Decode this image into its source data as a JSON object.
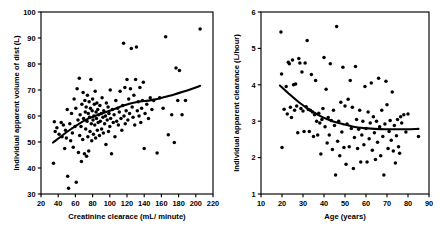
{
  "figure": {
    "background": "#ffffff",
    "ink": "#000000",
    "panel_count": 2
  },
  "chart_data": [
    {
      "type": "scatter",
      "panel": "left",
      "title": "",
      "xlabel": "Creatinine clearace (mL/ minute)",
      "ylabel": "Individual apparent volume of dist (L)",
      "xlim": [
        20,
        220
      ],
      "ylim": [
        30,
        100
      ],
      "xticks": [
        20,
        40,
        60,
        80,
        100,
        120,
        140,
        160,
        180,
        200,
        220
      ],
      "yticks": [
        30,
        40,
        50,
        60,
        70,
        80,
        90,
        100
      ],
      "grid": false,
      "legend": "none",
      "marker": "filled-circle",
      "points": [
        [
          34.5,
          41.8
        ],
        [
          35.5,
          57.8
        ],
        [
          36.5,
          54.0
        ],
        [
          38.5,
          55.5
        ],
        [
          41.0,
          53.0
        ],
        [
          43.5,
          57.5
        ],
        [
          44.5,
          52.0
        ],
        [
          46.0,
          56.5
        ],
        [
          47.5,
          47.5
        ],
        [
          48.5,
          54.5
        ],
        [
          49.5,
          51.5
        ],
        [
          50.5,
          62.5
        ],
        [
          51.0,
          36.8
        ],
        [
          52.0,
          32.2
        ],
        [
          53.5,
          57.0
        ],
        [
          54.5,
          50.5
        ],
        [
          55.5,
          61.0
        ],
        [
          56.5,
          53.5
        ],
        [
          57.5,
          48.0
        ],
        [
          58.5,
          66.5
        ],
        [
          59.5,
          56.0
        ],
        [
          60.5,
          63.0
        ],
        [
          61.0,
          34.5
        ],
        [
          62.0,
          70.5
        ],
        [
          63.0,
          58.5
        ],
        [
          63.5,
          46.0
        ],
        [
          64.5,
          74.5
        ],
        [
          65.0,
          52.5
        ],
        [
          65.5,
          60.5
        ],
        [
          66.5,
          56.0
        ],
        [
          67.0,
          42.5
        ],
        [
          67.5,
          64.5
        ],
        [
          68.5,
          51.0
        ],
        [
          69.0,
          69.0
        ],
        [
          69.5,
          59.0
        ],
        [
          70.5,
          45.5
        ],
        [
          71.0,
          66.0
        ],
        [
          71.5,
          61.5
        ],
        [
          72.0,
          55.0
        ],
        [
          72.5,
          63.5
        ],
        [
          73.0,
          44.5
        ],
        [
          73.5,
          58.0
        ],
        [
          74.0,
          68.0
        ],
        [
          74.5,
          52.0
        ],
        [
          75.0,
          61.0
        ],
        [
          75.5,
          46.5
        ],
        [
          76.0,
          65.5
        ],
        [
          76.5,
          59.5
        ],
        [
          77.0,
          54.0
        ],
        [
          77.5,
          63.0
        ],
        [
          78.0,
          74.0
        ],
        [
          78.5,
          57.0
        ],
        [
          79.0,
          50.5
        ],
        [
          79.5,
          62.0
        ],
        [
          80.0,
          66.5
        ],
        [
          80.5,
          58.5
        ],
        [
          81.0,
          53.0
        ],
        [
          81.5,
          60.0
        ],
        [
          82.0,
          64.5
        ],
        [
          82.5,
          56.5
        ],
        [
          83.0,
          69.5
        ],
        [
          83.5,
          51.5
        ],
        [
          84.0,
          61.5
        ],
        [
          84.5,
          59.0
        ],
        [
          85.0,
          65.0
        ],
        [
          85.5,
          54.5
        ],
        [
          86.0,
          62.5
        ],
        [
          86.5,
          57.5
        ],
        [
          87.0,
          60.5
        ],
        [
          88.0,
          52.5
        ],
        [
          88.5,
          64.0
        ],
        [
          89.0,
          58.0
        ],
        [
          90.0,
          61.0
        ],
        [
          90.5,
          55.0
        ],
        [
          91.0,
          67.0
        ],
        [
          92.0,
          59.5
        ],
        [
          92.5,
          53.5
        ],
        [
          93.0,
          62.0
        ],
        [
          94.0,
          57.0
        ],
        [
          95.0,
          60.0
        ],
        [
          95.5,
          49.0
        ],
        [
          96.0,
          65.0
        ],
        [
          97.0,
          58.5
        ],
        [
          98.0,
          63.5
        ],
        [
          98.5,
          54.0
        ],
        [
          99.0,
          61.0
        ],
        [
          100.0,
          56.0
        ],
        [
          100.5,
          70.0
        ],
        [
          101.0,
          59.0
        ],
        [
          102.0,
          45.5
        ],
        [
          103.0,
          62.5
        ],
        [
          104.0,
          57.5
        ],
        [
          105.0,
          60.5
        ],
        [
          106.0,
          52.0
        ],
        [
          107.0,
          66.0
        ],
        [
          108.0,
          58.0
        ],
        [
          109.0,
          63.0
        ],
        [
          110.0,
          56.5
        ],
        [
          111.0,
          61.5
        ],
        [
          112.0,
          69.5
        ],
        [
          113.0,
          59.0
        ],
        [
          114.0,
          54.5
        ],
        [
          115.0,
          64.0
        ],
        [
          116.0,
          88.0
        ],
        [
          116.5,
          60.0
        ],
        [
          117.5,
          71.0
        ],
        [
          118.0,
          57.0
        ],
        [
          119.0,
          62.0
        ],
        [
          120.0,
          74.0
        ],
        [
          121.0,
          58.5
        ],
        [
          122.0,
          66.5
        ],
        [
          123.0,
          61.0
        ],
        [
          124.0,
          70.5
        ],
        [
          125.0,
          86.0
        ],
        [
          126.0,
          63.5
        ],
        [
          127.0,
          59.5
        ],
        [
          128.0,
          68.0
        ],
        [
          129.0,
          56.5
        ],
        [
          130.0,
          74.0
        ],
        [
          131.0,
          86.5
        ],
        [
          132.0,
          62.0
        ],
        [
          133.0,
          65.5
        ],
        [
          134.0,
          60.0
        ],
        [
          135.0,
          71.0
        ],
        [
          136.0,
          57.5
        ],
        [
          137.0,
          63.0
        ],
        [
          138.0,
          66.0
        ],
        [
          139.0,
          73.0
        ],
        [
          140.0,
          47.5
        ],
        [
          141.0,
          61.0
        ],
        [
          143.0,
          64.5
        ],
        [
          145.0,
          59.0
        ],
        [
          147.0,
          67.0
        ],
        [
          149.0,
          62.5
        ],
        [
          151.0,
          66.0
        ],
        [
          155.0,
          45.8
        ],
        [
          158.0,
          67.0
        ],
        [
          162.0,
          63.0
        ],
        [
          165.0,
          90.5
        ],
        [
          168.0,
          52.8
        ],
        [
          172.0,
          60.5
        ],
        [
          175.0,
          49.8
        ],
        [
          177.0,
          78.5
        ],
        [
          179.0,
          66.0
        ],
        [
          181.0,
          77.5
        ],
        [
          184.0,
          60.5
        ],
        [
          188.0,
          66.0
        ],
        [
          205.0,
          93.5
        ]
      ],
      "trend": {
        "kind": "smoothed-fit",
        "description": "rising spline: steeper below CrCl 110, flattening above",
        "points": [
          [
            34,
            49.8
          ],
          [
            45,
            52.6
          ],
          [
            55,
            55.0
          ],
          [
            65,
            57.2
          ],
          [
            75,
            59.0
          ],
          [
            85,
            60.3
          ],
          [
            95,
            61.4
          ],
          [
            105,
            62.6
          ],
          [
            115,
            63.9
          ],
          [
            125,
            64.9
          ],
          [
            135,
            65.6
          ],
          [
            145,
            65.9
          ],
          [
            155,
            66.5
          ],
          [
            165,
            67.4
          ],
          [
            175,
            68.3
          ],
          [
            185,
            69.3
          ],
          [
            195,
            70.4
          ],
          [
            205,
            71.6
          ]
        ]
      }
    },
    {
      "type": "scatter",
      "panel": "right",
      "title": "",
      "xlabel": "Age (years)",
      "ylabel": "Individual apparent clearance (L/hour)",
      "xlim": [
        10,
        90
      ],
      "ylim": [
        1,
        6
      ],
      "xticks": [
        10,
        20,
        30,
        40,
        50,
        60,
        70,
        80,
        90
      ],
      "yticks": [
        1,
        2,
        3,
        4,
        5,
        6
      ],
      "grid": false,
      "legend": "none",
      "marker": "filled-circle",
      "points": [
        [
          19.5,
          5.45
        ],
        [
          19.8,
          4.3
        ],
        [
          20.0,
          2.28
        ],
        [
          21.0,
          3.33
        ],
        [
          22.0,
          3.95
        ],
        [
          22.5,
          3.2
        ],
        [
          23.0,
          4.62
        ],
        [
          23.5,
          4.58
        ],
        [
          24.0,
          3.38
        ],
        [
          24.5,
          3.1
        ],
        [
          25.0,
          4.68
        ],
        [
          25.5,
          4.0
        ],
        [
          26.0,
          3.3
        ],
        [
          26.5,
          4.02
        ],
        [
          27.0,
          3.42
        ],
        [
          27.5,
          2.68
        ],
        [
          28.0,
          4.72
        ],
        [
          28.5,
          4.6
        ],
        [
          29.0,
          3.35
        ],
        [
          29.5,
          4.35
        ],
        [
          30.0,
          3.28
        ],
        [
          30.5,
          2.72
        ],
        [
          31.0,
          4.6
        ],
        [
          31.5,
          3.4
        ],
        [
          32.0,
          5.22
        ],
        [
          32.5,
          3.32
        ],
        [
          33.0,
          2.72
        ],
        [
          33.5,
          3.3
        ],
        [
          34.0,
          4.28
        ],
        [
          34.5,
          3.25
        ],
        [
          35.0,
          2.58
        ],
        [
          35.5,
          3.18
        ],
        [
          36.0,
          4.12
        ],
        [
          36.5,
          3.0
        ],
        [
          37.0,
          2.62
        ],
        [
          37.5,
          3.22
        ],
        [
          38.0,
          2.95
        ],
        [
          38.5,
          2.1
        ],
        [
          39.0,
          3.05
        ],
        [
          39.5,
          3.35
        ],
        [
          40.0,
          4.75
        ],
        [
          40.5,
          2.85
        ],
        [
          41.0,
          3.88
        ],
        [
          41.5,
          2.4
        ],
        [
          42.0,
          3.1
        ],
        [
          42.5,
          2.62
        ],
        [
          43.0,
          4.58
        ],
        [
          43.5,
          3.02
        ],
        [
          44.0,
          2.22
        ],
        [
          44.5,
          3.3
        ],
        [
          45.0,
          2.88
        ],
        [
          45.5,
          1.52
        ],
        [
          46.0,
          5.6
        ],
        [
          46.5,
          2.45
        ],
        [
          47.0,
          3.0
        ],
        [
          47.5,
          2.05
        ],
        [
          48.0,
          3.52
        ],
        [
          48.5,
          2.7
        ],
        [
          49.0,
          4.48
        ],
        [
          49.5,
          2.28
        ],
        [
          50.0,
          3.42
        ],
        [
          50.5,
          1.82
        ],
        [
          51.0,
          2.92
        ],
        [
          51.5,
          3.6
        ],
        [
          52.0,
          2.3
        ],
        [
          52.5,
          4.12
        ],
        [
          53.0,
          2.8
        ],
        [
          53.5,
          3.38
        ],
        [
          54.0,
          1.7
        ],
        [
          54.5,
          2.55
        ],
        [
          55.0,
          4.5
        ],
        [
          55.5,
          3.05
        ],
        [
          56.0,
          2.25
        ],
        [
          56.5,
          2.78
        ],
        [
          57.0,
          3.3
        ],
        [
          57.5,
          1.88
        ],
        [
          58.0,
          2.62
        ],
        [
          58.5,
          3.0
        ],
        [
          59.0,
          2.35
        ],
        [
          59.5,
          3.95
        ],
        [
          60.0,
          2.8
        ],
        [
          60.5,
          1.88
        ],
        [
          61.0,
          3.25
        ],
        [
          61.5,
          2.52
        ],
        [
          62.0,
          2.95
        ],
        [
          62.5,
          4.05
        ],
        [
          63.0,
          2.2
        ],
        [
          63.5,
          3.12
        ],
        [
          64.0,
          2.68
        ],
        [
          64.5,
          1.95
        ],
        [
          65.0,
          3.0
        ],
        [
          65.5,
          2.42
        ],
        [
          66.0,
          4.18
        ],
        [
          66.5,
          2.85
        ],
        [
          67.0,
          2.05
        ],
        [
          67.5,
          3.3
        ],
        [
          68.0,
          2.58
        ],
        [
          68.5,
          1.52
        ],
        [
          69.0,
          2.92
        ],
        [
          69.5,
          4.1
        ],
        [
          70.0,
          3.45
        ],
        [
          70.5,
          2.25
        ],
        [
          71.0,
          2.72
        ],
        [
          71.5,
          3.02
        ],
        [
          72.0,
          2.48
        ],
        [
          72.5,
          3.8
        ],
        [
          73.0,
          2.18
        ],
        [
          73.5,
          2.88
        ],
        [
          74.0,
          1.85
        ],
        [
          74.5,
          2.6
        ],
        [
          75.0,
          3.05
        ],
        [
          75.5,
          2.3
        ],
        [
          76.0,
          2.12
        ],
        [
          76.5,
          3.12
        ],
        [
          77.0,
          2.95
        ],
        [
          78.0,
          3.18
        ],
        [
          79.0,
          2.7
        ],
        [
          80.0,
          3.2
        ],
        [
          85.0,
          2.58
        ]
      ],
      "trend": {
        "kind": "smoothed-fit",
        "description": "decaying curve: falls from ~4.0 at age 19 to ~2.8 by age 60, then flat",
        "points": [
          [
            19,
            3.98
          ],
          [
            24,
            3.72
          ],
          [
            29,
            3.48
          ],
          [
            34,
            3.28
          ],
          [
            39,
            3.12
          ],
          [
            44,
            3.0
          ],
          [
            49,
            2.92
          ],
          [
            54,
            2.85
          ],
          [
            59,
            2.81
          ],
          [
            64,
            2.79
          ],
          [
            69,
            2.78
          ],
          [
            74,
            2.78
          ],
          [
            79,
            2.78
          ],
          [
            85,
            2.79
          ]
        ]
      }
    }
  ]
}
